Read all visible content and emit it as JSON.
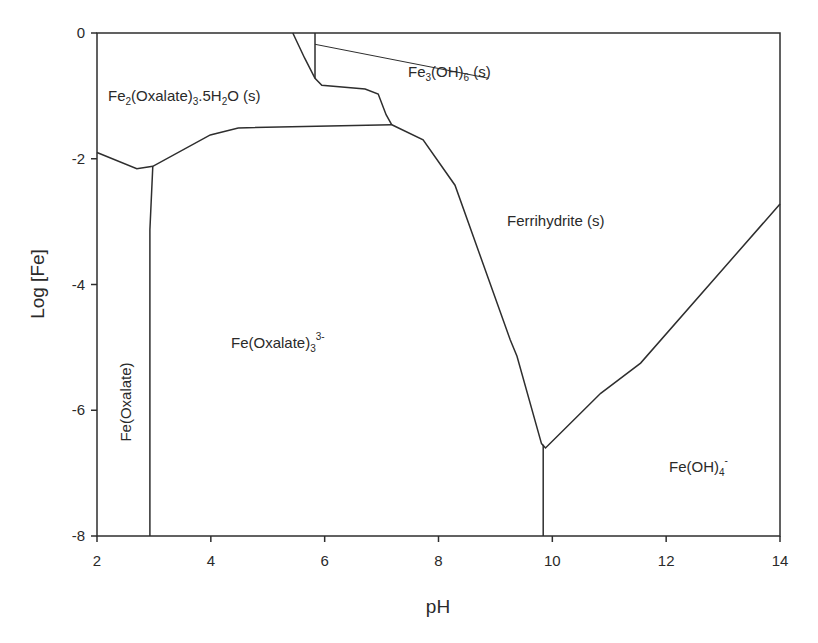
{
  "chart_data": {
    "type": "line",
    "title": "",
    "subtitle": "",
    "xlabel": "pH",
    "ylabel": "Log [Fe]",
    "xlim": [
      2,
      14
    ],
    "ylim": [
      -8,
      0
    ],
    "xticks": [
      2,
      4,
      6,
      8,
      10,
      12,
      14
    ],
    "yticks": [
      0,
      -2,
      -4,
      -6,
      -8
    ],
    "grid": false,
    "legend": null,
    "series": [
      {
        "name": "Fe2(Oxalate)3.5H2O(s) lower boundary",
        "x": [
          2.0,
          2.7,
          2.98,
          3.99,
          4.48,
          7.18
        ],
        "y": [
          -1.9,
          -2.16,
          -2.12,
          -1.62,
          -1.51,
          -1.46
        ]
      },
      {
        "name": "Fe(Oxalate) / Fe(Oxalate)3 3- boundary",
        "x": [
          2.98,
          2.93,
          2.93
        ],
        "y": [
          -2.12,
          -3.13,
          -8.0
        ]
      },
      {
        "name": "Fe2(Oxalate)3.5H2O(s) / Fe3(OH)6(s) upper boundary",
        "x": [
          5.44,
          5.65,
          5.83,
          5.95,
          6.71,
          6.94,
          7.08,
          7.18
        ],
        "y": [
          0.0,
          -0.4,
          -0.72,
          -0.83,
          -0.89,
          -0.97,
          -1.3,
          -1.46
        ]
      },
      {
        "name": "Fe3(OH)6(s) vertical boundary",
        "x": [
          5.83,
          5.83
        ],
        "y": [
          0.0,
          -0.72
        ]
      },
      {
        "name": "Ferrihydrite(s) boundary",
        "x": [
          7.18,
          7.73,
          8.29,
          9.26,
          9.38,
          9.81,
          9.88,
          10.85,
          11.55,
          14.0
        ],
        "y": [
          -1.46,
          -1.7,
          -2.42,
          -4.88,
          -5.14,
          -6.53,
          -6.6,
          -5.73,
          -5.25,
          -2.72
        ]
      },
      {
        "name": "Fe(Oxalate)3 3- / Fe(OH)4 - boundary",
        "x": [
          9.84,
          9.84
        ],
        "y": [
          -6.55,
          -8.0
        ]
      },
      {
        "name": "Fe3(OH)6 label leader line",
        "x": [
          5.83,
          8.88
        ],
        "y": [
          -0.18,
          -0.72
        ]
      }
    ],
    "annotations": [
      {
        "text": "Fe2(Oxalate)3.5H2O (s)",
        "x": 2.3,
        "y": -1.0
      },
      {
        "text": "Fe3(OH)6 (s)",
        "x": 8.9,
        "y": -0.65
      },
      {
        "text": "Ferrihydrite (s)",
        "x": 9.1,
        "y": -3.1
      },
      {
        "text": "Fe(Oxalate)3 3-",
        "x": 5.3,
        "y": -5.6
      },
      {
        "text": "Fe(Oxalate)",
        "x": 2.45,
        "y": -5.2,
        "rotation": -90
      },
      {
        "text": "Fe(OH)4 -",
        "x": 12.4,
        "y": -7.0
      }
    ]
  },
  "axes": {
    "x_title": "pH",
    "y_title": "Log [Fe]",
    "x_ticks": [
      "2",
      "4",
      "6",
      "8",
      "10",
      "12",
      "14"
    ],
    "y_ticks": [
      "0",
      "-2",
      "-4",
      "-6",
      "-8"
    ]
  },
  "labels": {
    "fe2_oxalate": {
      "base": "Fe",
      "s1": "2",
      "mid": "(Oxalate)",
      "s2": "3",
      "mid2": ".5H",
      "s3": "2",
      "tail": "O (s)"
    },
    "fe3_oh6": {
      "base": "Fe",
      "s1": "3",
      "mid": "(OH)",
      "s2": "6",
      "tail": " (s)"
    },
    "ferrihydrite": "Ferrihydrite (s)",
    "fe_oxalate3": {
      "base": "Fe(Oxalate)",
      "sub": "3",
      "sup": "3-"
    },
    "fe_oxalate": "Fe(Oxalate)",
    "fe_oh4": {
      "base": "Fe(OH)",
      "sub": "4",
      "sup": "-"
    }
  },
  "colors": {
    "line": "#2e2e2e",
    "text": "#2a2a2a",
    "background": "#ffffff"
  }
}
